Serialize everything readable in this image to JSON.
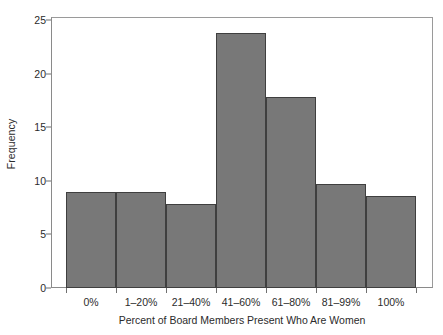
{
  "chart_data": {
    "type": "bar",
    "title": "",
    "xlabel": "Percent of Board Members Present Who Are Women",
    "ylabel": "Frequency",
    "categories": [
      "0%",
      "1–20%",
      "21–40%",
      "41–60%",
      "61–80%",
      "81–99%",
      "100%"
    ],
    "values": [
      9.0,
      9.0,
      7.8,
      23.8,
      17.8,
      9.7,
      8.6
    ],
    "ylim": [
      0,
      25
    ],
    "yticks": [
      0,
      5,
      10,
      15,
      20,
      25
    ],
    "ytick_labels": [
      "0",
      "5",
      "10",
      "15",
      "20",
      "25"
    ],
    "grid": false,
    "legend": null,
    "bar_color": "#787878",
    "bar_edge_color": "#3f3f3f",
    "axis_color": "#8a8a8a",
    "background_color": "#ffffff",
    "text_color": "#2b2b2b"
  }
}
